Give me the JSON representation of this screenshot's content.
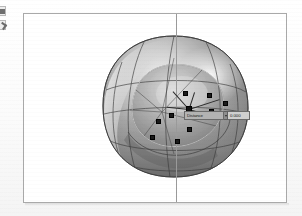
{
  "app": {
    "background_color": "#fdfdfd",
    "viewport_background": "#ffffff",
    "viewport_border_color": "#a9a9a9"
  },
  "toolbar": {
    "buttons": [
      {
        "name": "select-tool",
        "icon": "square-select-icon",
        "label": ""
      },
      {
        "name": "move-tool",
        "icon": "arrow-cursor-icon",
        "label": ""
      }
    ]
  },
  "viewport": {
    "name": "perspective-viewport",
    "axis_line": {
      "name": "construction-axis-vertical",
      "orientation": "vertical",
      "color": "#9a9a9a"
    }
  },
  "model": {
    "name": "pod-chair-surface",
    "description": "Shaded NURBS pod / egg lounge chair surface",
    "shading": "metallic-grey",
    "highlight_color": "#f2f2f2",
    "shadow_color": "#4e4e4e",
    "isoparm_color": "#3c3c3c"
  },
  "control_points": {
    "marker_color": "#1a1a1a",
    "points": [
      {
        "x": 160,
        "y": 78
      },
      {
        "x": 184,
        "y": 80
      },
      {
        "x": 200,
        "y": 88
      },
      {
        "x": 164,
        "y": 94
      },
      {
        "x": 186,
        "y": 96
      },
      {
        "x": 146,
        "y": 100
      },
      {
        "x": 133,
        "y": 106
      },
      {
        "x": 164,
        "y": 114
      },
      {
        "x": 127,
        "y": 122
      },
      {
        "x": 152,
        "y": 126
      },
      {
        "x": 176,
        "y": 110
      }
    ]
  },
  "gizmo": {
    "name": "point-edit-gizmo",
    "origin": {
      "x": 164,
      "y": 94
    },
    "handles": [
      {
        "name": "handle-up",
        "angle_deg": -72,
        "length": 18
      },
      {
        "name": "handle-right",
        "angle_deg": -18,
        "length": 30
      },
      {
        "name": "handle-down-right",
        "angle_deg": 16,
        "length": 24
      },
      {
        "name": "handle-left",
        "angle_deg": 186,
        "length": 20
      },
      {
        "name": "handle-up-left",
        "angle_deg": 228,
        "length": 22
      }
    ]
  },
  "tooltip": {
    "name": "numeric-edit-tooltip",
    "label": "Distance",
    "value": "0.000",
    "caret_icon": "chevron-down-icon",
    "label_bg": "#b3b3b3",
    "value_bg": "#cfcfcf"
  }
}
